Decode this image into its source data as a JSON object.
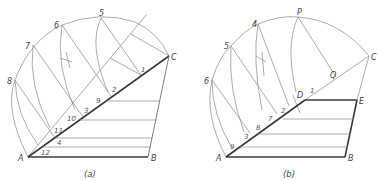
{
  "figures": [
    {
      "id": "a",
      "caption": "(a)",
      "vertex_labels": {
        "A": "A",
        "B": "B",
        "C": "C"
      },
      "arc_point_labels": [
        "8",
        "7",
        "6",
        "5"
      ],
      "division_labels": [
        "1",
        "2",
        "9",
        "3",
        "10",
        "11",
        "4",
        "12"
      ]
    },
    {
      "id": "b",
      "caption": "(b)",
      "vertex_labels": {
        "A": "A",
        "B": "B",
        "C": "C",
        "D": "D",
        "E": "E",
        "P": "P",
        "Q": "Q"
      },
      "arc_point_labels": [
        "6",
        "5",
        "4"
      ],
      "division_labels": [
        "1",
        "2",
        "7",
        "8",
        "3",
        "9"
      ]
    }
  ]
}
